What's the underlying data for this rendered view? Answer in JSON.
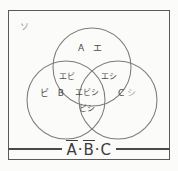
{
  "diagram": {
    "universe_marker": "ソ",
    "frame_color": "#5a5a5a",
    "circle_color": "#7b7b7b",
    "background_color": "#fbfbf9",
    "text_color": "#4a4a4a"
  },
  "sets": [
    {
      "id": "A",
      "label": "A",
      "position": "top"
    },
    {
      "id": "B",
      "label": "B",
      "position": "bottom-left"
    },
    {
      "id": "C",
      "label": "C",
      "position": "bottom-right"
    }
  ],
  "regions": {
    "a_only": {
      "name": "A-only",
      "text": "A エ"
    },
    "a_and_b": {
      "name": "A∩B",
      "text": "エビ"
    },
    "a_and_c": {
      "name": "A∩C",
      "text": "エシ"
    },
    "a_b_c": {
      "name": "A∩B∩C",
      "text": "エビシ"
    },
    "b_and_c": {
      "name": "B∩C",
      "text": "ビシ"
    },
    "b_only": {
      "name": "B-only",
      "text": "ビ  B"
    },
    "c_only": {
      "name": "C-only",
      "text": "C",
      "annotation": "シ"
    }
  },
  "formula": {
    "full_text": "Ā·B̄·C",
    "terms": [
      {
        "symbol": "A",
        "overbar": true
      },
      {
        "symbol": "B",
        "overbar": true
      },
      {
        "symbol": "C",
        "overbar": false
      }
    ],
    "separator": "·"
  },
  "geometry": {
    "circle_a": {
      "cx": 84,
      "cy": 57,
      "r": 39
    },
    "circle_b": {
      "cx": 58,
      "cy": 90,
      "r": 39
    },
    "circle_c": {
      "cx": 110,
      "cy": 90,
      "r": 39
    }
  }
}
